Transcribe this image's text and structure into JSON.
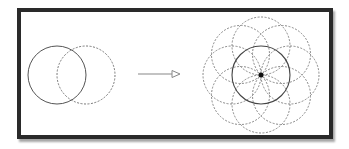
{
  "diagram": {
    "title": "",
    "frame": {
      "left": 17,
      "top": 8,
      "right": 334,
      "bottom": 139,
      "border_color": "#2a2a2a"
    },
    "left_figure": {
      "description": "Two overlapping circles",
      "circles": [
        {
          "cx": 57,
          "cy": 75,
          "r": 29,
          "style": "solid",
          "color": "#555555"
        },
        {
          "cx": 86,
          "cy": 75,
          "r": 29,
          "style": "dashed",
          "color": "#777777"
        }
      ]
    },
    "arrow": {
      "x1": 138,
      "y1": 74,
      "x2": 180,
      "y2": 74,
      "head": "hollow-triangle",
      "color": "#888888"
    },
    "right_figure": {
      "description": "Flower of life pattern: central solid circle with eight dashed circles around a center point",
      "center": {
        "x": 261,
        "y": 75
      },
      "radius": 29,
      "central_circle_style": "solid",
      "petal_count": 8,
      "petal_style": "dashed",
      "center_dot_color": "#111111"
    }
  }
}
